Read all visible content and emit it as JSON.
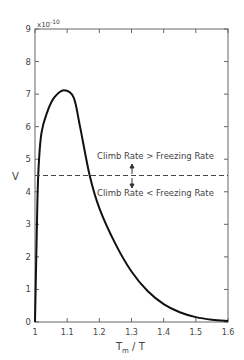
{
  "chart_data": {
    "type": "line",
    "title": "",
    "xlabel": "T_m / T",
    "ylabel": "V",
    "y_multiplier": "x10^-10",
    "xlim": [
      1.0,
      1.6
    ],
    "ylim": [
      0,
      9
    ],
    "x_ticks": [
      "1",
      "1.1",
      "1.2",
      "1.3",
      "1.4",
      "1.5",
      "1.6"
    ],
    "y_ticks": [
      "0",
      "1",
      "2",
      "3",
      "4",
      "5",
      "6",
      "7",
      "8",
      "9"
    ],
    "grid": false,
    "series": [
      {
        "name": "V",
        "style": "solid",
        "x": [
          1.0,
          1.005,
          1.01,
          1.02,
          1.04,
          1.06,
          1.09,
          1.12,
          1.14,
          1.17,
          1.2,
          1.25,
          1.3,
          1.35,
          1.4,
          1.45,
          1.5,
          1.55,
          1.6
        ],
        "y": [
          0,
          2.5,
          4.5,
          5.8,
          6.5,
          6.9,
          7.12,
          6.9,
          6.0,
          4.5,
          3.5,
          2.4,
          1.55,
          0.95,
          0.55,
          0.3,
          0.15,
          0.07,
          0.03
        ]
      },
      {
        "name": "threshold",
        "style": "dashed",
        "x": [
          1.0,
          1.6
        ],
        "y": [
          4.5,
          4.5
        ]
      }
    ],
    "annotations": [
      {
        "text": "Climb Rate > Freezing Rate",
        "x": 1.39,
        "y": 4.95
      },
      {
        "text": "Climb Rate < Freezing Rate",
        "x": 1.39,
        "y": 3.9
      }
    ]
  },
  "labels": {
    "xlabel_main": "T",
    "xlabel_sub": "m",
    "xlabel_rest": " / T",
    "ylabel": "V",
    "multiplier_base": "x10",
    "multiplier_exp": "-10",
    "annot_above": "Climb Rate > Freezing Rate",
    "annot_below": "Climb Rate < Freezing Rate"
  }
}
